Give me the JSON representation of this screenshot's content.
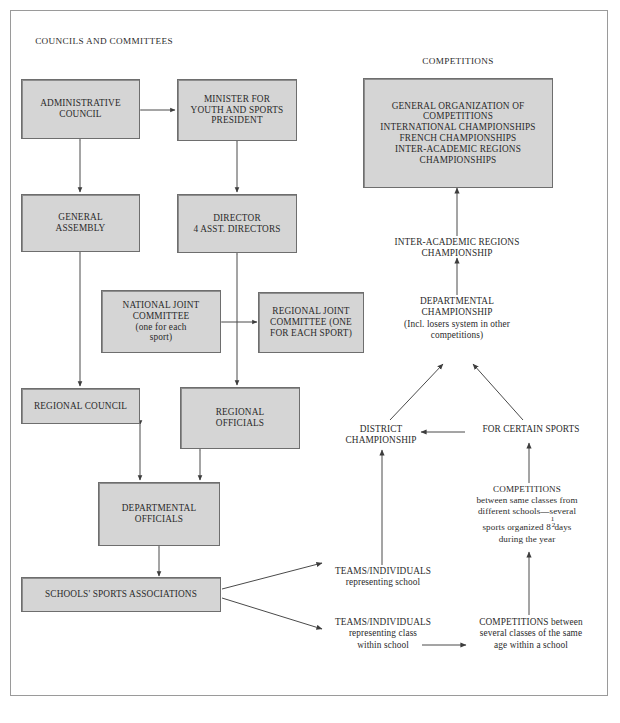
{
  "diagram": {
    "headings": [
      {
        "id": "councils",
        "text": "COUNCILS AND COMMITTEES"
      },
      {
        "id": "competitions",
        "text": "COMPETITIONS"
      }
    ],
    "boxes": [
      {
        "id": "administrative-council",
        "lines": [
          "ADMINISTRATIVE",
          "COUNCIL"
        ]
      },
      {
        "id": "minister-youth-sports",
        "lines": [
          "MINISTER FOR",
          "YOUTH AND SPORTS",
          "PRESIDENT"
        ]
      },
      {
        "id": "general-organization",
        "lines": [
          "GENERAL ORGANIZATION OF",
          "COMPETITIONS",
          "INTERNATIONAL CHAMPIONSHIPS",
          "FRENCH CHAMPIONSHIPS",
          "INTER-ACADEMIC REGIONS",
          "CHAMPIONSHIPS"
        ]
      },
      {
        "id": "general-assembly",
        "lines": [
          "GENERAL",
          "ASSEMBLY"
        ]
      },
      {
        "id": "director",
        "lines": [
          "DIRECTOR",
          "4 ASST. DIRECTORS"
        ]
      },
      {
        "id": "national-joint-committee",
        "lines": [
          "NATIONAL JOINT",
          "COMMITTEE",
          "(one for each",
          "sport)"
        ]
      },
      {
        "id": "regional-joint-committee",
        "lines": [
          "REGIONAL JOINT",
          "COMMITTEE (ONE",
          "FOR EACH SPORT)"
        ]
      },
      {
        "id": "regional-council",
        "lines": [
          "REGIONAL COUNCIL"
        ]
      },
      {
        "id": "regional-officials",
        "lines": [
          "REGIONAL",
          "OFFICIALS"
        ]
      },
      {
        "id": "departmental-officials",
        "lines": [
          "DEPARTMENTAL",
          "OFFICIALS"
        ]
      },
      {
        "id": "schools-sports-associations",
        "lines": [
          "SCHOOLS' SPORTS ASSOCIATIONS"
        ]
      }
    ],
    "labels": [
      {
        "id": "inter-academic-regions-championship",
        "lines": [
          "INTER-ACADEMIC REGIONS",
          "CHAMPIONSHIP"
        ]
      },
      {
        "id": "departmental-championship",
        "lines": [
          "DEPARTMENTAL",
          "CHAMPIONSHIP",
          "(Incl. losers system in other",
          "competitions)"
        ]
      },
      {
        "id": "district-championship",
        "lines": [
          "DISTRICT",
          "CHAMPIONSHIP"
        ]
      },
      {
        "id": "for-certain-sports",
        "lines": [
          "FOR CERTAIN SPORTS"
        ]
      },
      {
        "id": "competitions-between-classes-different-schools",
        "lines": [
          "COMPETITIONS",
          "between same classes from",
          "different schools—several",
          "sports organized 8 1/2 days",
          "during the year"
        ]
      },
      {
        "id": "teams-individuals-school",
        "lines": [
          "TEAMS/INDIVIDUALS",
          "representing school"
        ]
      },
      {
        "id": "teams-individuals-class",
        "lines": [
          "TEAMS/INDIVIDUALS",
          "representing class",
          "within school"
        ]
      },
      {
        "id": "competitions-same-age-within-school",
        "lines": [
          "COMPETITIONS between",
          "several classes of the same",
          "age within a school"
        ]
      }
    ],
    "fraction": {
      "whole": "8",
      "numerator": "1",
      "denominator": "2",
      "unit": "days"
    },
    "colors": {
      "box_fill": "#d5d5d5",
      "box_border": "#6e6e6e",
      "line": "#4a4a4a",
      "frame": "#9a9a9a",
      "text": "#2b2b2b"
    }
  }
}
